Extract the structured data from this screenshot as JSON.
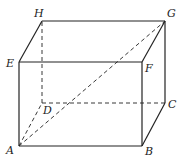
{
  "diagram": {
    "title": "",
    "type": "rectangular-prism",
    "vertices": [
      "A",
      "B",
      "C",
      "D",
      "E",
      "F",
      "G",
      "H"
    ],
    "labels": {
      "A": "A",
      "B": "B",
      "C": "C",
      "D": "D",
      "E": "E",
      "F": "F",
      "G": "G",
      "H": "H"
    },
    "solid_edges": [
      [
        "A",
        "B"
      ],
      [
        "B",
        "F"
      ],
      [
        "F",
        "E"
      ],
      [
        "E",
        "A"
      ],
      [
        "E",
        "H"
      ],
      [
        "H",
        "G"
      ],
      [
        "G",
        "F"
      ],
      [
        "G",
        "C"
      ],
      [
        "C",
        "B"
      ]
    ],
    "hidden_edges": [
      [
        "A",
        "D"
      ],
      [
        "D",
        "C"
      ],
      [
        "D",
        "H"
      ]
    ],
    "diagonals": [
      {
        "from": "A",
        "to": "G",
        "style": "dashed"
      }
    ],
    "stroke_color": "#222222"
  }
}
